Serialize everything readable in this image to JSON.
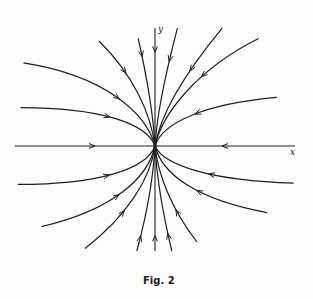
{
  "figure": {
    "caption": "Fig. 2",
    "x_axis_label": "x",
    "y_axis_label": "y",
    "type": "phase portrait (stable node, trajectories tangent to y-axis at origin)",
    "colors": {
      "ink": "#1e1e1e",
      "background": "#fdfdfd"
    }
  },
  "trajectories": [
    {
      "name": "x-axis-left",
      "points": [
        [
          -1.0,
          0
        ],
        [
          0,
          0
        ]
      ],
      "arrow_at": 0.55
    },
    {
      "name": "x-axis-right",
      "points": [
        [
          1.0,
          0
        ],
        [
          0,
          0
        ]
      ],
      "arrow_at": 0.5
    },
    {
      "name": "y-axis-top",
      "points": [
        [
          0,
          0.92
        ],
        [
          0,
          0
        ]
      ],
      "arrow_at": 0.18
    },
    {
      "name": "y-axis-bottom",
      "points": [
        [
          0,
          -0.82
        ],
        [
          0,
          0
        ]
      ],
      "arrow_at": 0.12
    },
    {
      "name": "ul-1",
      "points": [
        [
          -0.94,
          0.65
        ],
        [
          -0.35,
          0.55
        ],
        [
          -0.06,
          0.25
        ],
        [
          0,
          0
        ]
      ],
      "arrow_at": 0.5
    },
    {
      "name": "ul-2",
      "points": [
        [
          -0.96,
          0.3
        ],
        [
          -0.4,
          0.3
        ],
        [
          -0.06,
          0.18
        ],
        [
          0,
          0
        ]
      ],
      "arrow_at": 0.45
    },
    {
      "name": "ul-3",
      "points": [
        [
          -0.4,
          0.82
        ],
        [
          -0.15,
          0.55
        ],
        [
          -0.03,
          0.25
        ],
        [
          0,
          0
        ]
      ],
      "arrow_at": 0.28
    },
    {
      "name": "ul-4",
      "points": [
        [
          -0.12,
          0.84
        ],
        [
          -0.05,
          0.5
        ],
        [
          -0.01,
          0.2
        ],
        [
          0,
          0
        ]
      ],
      "arrow_at": 0.12
    },
    {
      "name": "ur-1",
      "points": [
        [
          0.16,
          0.92
        ],
        [
          0.06,
          0.5
        ],
        [
          0.01,
          0.2
        ],
        [
          0,
          0
        ]
      ],
      "arrow_at": 0.2
    },
    {
      "name": "ur-2",
      "points": [
        [
          0.48,
          0.92
        ],
        [
          0.2,
          0.55
        ],
        [
          0.04,
          0.25
        ],
        [
          0,
          0
        ]
      ],
      "arrow_at": 0.3
    },
    {
      "name": "ur-3",
      "points": [
        [
          0.74,
          0.84
        ],
        [
          0.3,
          0.6
        ],
        [
          0.05,
          0.25
        ],
        [
          0,
          0
        ]
      ],
      "arrow_at": 0.35
    },
    {
      "name": "ur-4",
      "points": [
        [
          0.87,
          0.38
        ],
        [
          0.35,
          0.33
        ],
        [
          0.05,
          0.18
        ],
        [
          0,
          0
        ]
      ],
      "arrow_at": 0.45
    },
    {
      "name": "ll-1",
      "points": [
        [
          -0.98,
          -0.3
        ],
        [
          -0.4,
          -0.3
        ],
        [
          -0.06,
          -0.18
        ],
        [
          0,
          0
        ]
      ],
      "arrow_at": 0.45
    },
    {
      "name": "ll-2",
      "points": [
        [
          -0.81,
          -0.63
        ],
        [
          -0.3,
          -0.5
        ],
        [
          -0.05,
          -0.25
        ],
        [
          0,
          0
        ]
      ],
      "arrow_at": 0.45
    },
    {
      "name": "ll-3",
      "points": [
        [
          -0.5,
          -0.8
        ],
        [
          -0.2,
          -0.55
        ],
        [
          -0.03,
          -0.25
        ],
        [
          0,
          0
        ]
      ],
      "arrow_at": 0.35
    },
    {
      "name": "ll-4",
      "points": [
        [
          -0.13,
          -0.82
        ],
        [
          -0.05,
          -0.5
        ],
        [
          -0.01,
          -0.2
        ],
        [
          0,
          0
        ]
      ],
      "arrow_at": 0.1
    },
    {
      "name": "lr-1",
      "points": [
        [
          0.12,
          -0.82
        ],
        [
          0.05,
          -0.5
        ],
        [
          0.01,
          -0.2
        ],
        [
          0,
          0
        ]
      ],
      "arrow_at": 0.12
    },
    {
      "name": "lr-2",
      "points": [
        [
          0.3,
          -0.75
        ],
        [
          0.12,
          -0.5
        ],
        [
          0.02,
          -0.22
        ],
        [
          0,
          0
        ]
      ],
      "arrow_at": 0.3
    },
    {
      "name": "lr-3",
      "points": [
        [
          0.8,
          -0.52
        ],
        [
          0.3,
          -0.42
        ],
        [
          0.05,
          -0.22
        ],
        [
          0,
          0
        ]
      ],
      "arrow_at": 0.4
    },
    {
      "name": "lr-4",
      "points": [
        [
          0.99,
          -0.29
        ],
        [
          0.4,
          -0.27
        ],
        [
          0.06,
          -0.15
        ],
        [
          0,
          0
        ]
      ],
      "arrow_at": 0.4
    }
  ]
}
